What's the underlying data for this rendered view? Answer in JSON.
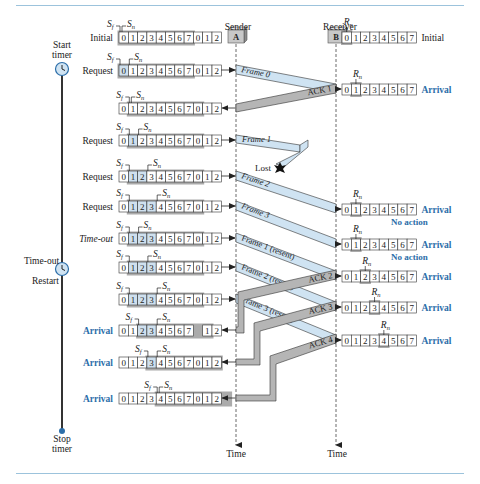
{
  "header": {
    "rule_color": "#9cc3dc"
  },
  "colors": {
    "frame_fill": "#cfe3f2",
    "ack_fill": "#b5b5b5",
    "window_shade": "#8f8f8f",
    "acked_cell": "#cfe0ee",
    "arrival_text": "#2c6ea9",
    "timer_line": "#333333",
    "stop_dot": "#2c6ea9"
  },
  "columns": {
    "sender": {
      "label": "Sender",
      "box": "A",
      "time_label": "Time"
    },
    "receiver": {
      "label": "Receiver",
      "box": "B",
      "time_label": "Time"
    }
  },
  "timer": {
    "start_label_1": "Start",
    "start_label_2": "timer",
    "timeout_label": "Time-out",
    "restart_label": "Restart",
    "stop_label_1": "Stop",
    "stop_label_2": "timer"
  },
  "sender_rows": [
    {
      "y": 37,
      "event": "Initial",
      "style": "plain",
      "cells": [
        "0",
        "1",
        "2",
        "3",
        "4",
        "5",
        "6",
        "7",
        "0",
        "1",
        "2"
      ],
      "sf": 0,
      "sn": 0,
      "acked": [],
      "shade": [
        0,
        7
      ],
      "gap": null,
      "arrow": "none"
    },
    {
      "y": 70,
      "event": "Request",
      "style": "plain",
      "cells": [
        "0",
        "1",
        "2",
        "3",
        "4",
        "5",
        "6",
        "7",
        "0",
        "1",
        "2"
      ],
      "sf": 0,
      "sn": 1,
      "acked": [
        0
      ],
      "shade": [
        0,
        7
      ],
      "gap": null,
      "arrow": "out"
    },
    {
      "y": 108,
      "event": "",
      "style": "plain",
      "cells": [
        "0",
        "1",
        "2",
        "3",
        "4",
        "5",
        "6",
        "7",
        "0",
        "1",
        "2"
      ],
      "sf": 1,
      "sn": 1,
      "acked": [],
      "shade": [
        1,
        8
      ],
      "gap": null,
      "arrow": "in"
    },
    {
      "y": 140,
      "event": "Request",
      "style": "plain",
      "cells": [
        "0",
        "1",
        "2",
        "3",
        "4",
        "5",
        "6",
        "7",
        "0",
        "1",
        "2"
      ],
      "sf": 1,
      "sn": 2,
      "acked": [
        1
      ],
      "shade": [
        1,
        8
      ],
      "gap": null,
      "arrow": "out"
    },
    {
      "y": 176,
      "event": "Request",
      "style": "plain",
      "cells": [
        "0",
        "1",
        "2",
        "3",
        "4",
        "5",
        "6",
        "7",
        "0",
        "1",
        "2"
      ],
      "sf": 1,
      "sn": 3,
      "acked": [
        1,
        2
      ],
      "shade": [
        1,
        8
      ],
      "gap": null,
      "arrow": "out"
    },
    {
      "y": 206,
      "event": "Request",
      "style": "plain",
      "cells": [
        "0",
        "1",
        "2",
        "3",
        "4",
        "5",
        "6",
        "7",
        "0",
        "1",
        "2"
      ],
      "sf": 1,
      "sn": 4,
      "acked": [
        1,
        2,
        3
      ],
      "shade": [
        1,
        8
      ],
      "gap": null,
      "arrow": "out"
    },
    {
      "y": 238,
      "event": "Time-out",
      "style": "italic",
      "cells": [
        "0",
        "1",
        "2",
        "3",
        "4",
        "5",
        "6",
        "7",
        "0",
        "1",
        "2"
      ],
      "sf": 1,
      "sn": 2,
      "acked": [
        1,
        2,
        3
      ],
      "shade": [
        1,
        8
      ],
      "gap": null,
      "arrow": "out"
    },
    {
      "y": 267,
      "event": "",
      "style": "plain",
      "cells": [
        "0",
        "1",
        "2",
        "3",
        "4",
        "5",
        "6",
        "7",
        "0",
        "1",
        "2"
      ],
      "sf": 1,
      "sn": 3,
      "acked": [
        1,
        2,
        3
      ],
      "shade": [
        1,
        8
      ],
      "gap": null,
      "arrow": "out"
    },
    {
      "y": 299,
      "event": "",
      "style": "plain",
      "cells": [
        "0",
        "1",
        "2",
        "3",
        "4",
        "5",
        "6",
        "7",
        "0",
        "1",
        "2"
      ],
      "sf": 1,
      "sn": 4,
      "acked": [
        1,
        2,
        3
      ],
      "shade": [
        1,
        8
      ],
      "gap": null,
      "arrow": "out"
    },
    {
      "y": 330,
      "event": "Arrival",
      "style": "blue",
      "cells": [
        "0",
        "1",
        "2",
        "3",
        "4",
        "5",
        "6",
        "7",
        "",
        "1",
        "2"
      ],
      "sf": 2,
      "sn": 4,
      "acked": [
        2,
        3
      ],
      "shade": [
        2,
        9
      ],
      "gap": 8,
      "arrow": "in"
    },
    {
      "y": 362,
      "event": "Arrival",
      "style": "blue",
      "cells": [
        "0",
        "1",
        "2",
        "3",
        "4",
        "5",
        "6",
        "7",
        "0",
        "1",
        "2"
      ],
      "sf": 3,
      "sn": 4,
      "acked": [
        3
      ],
      "shade": [
        3,
        10
      ],
      "gap": null,
      "arrow": "in"
    },
    {
      "y": 398,
      "event": "Arrival",
      "style": "blue",
      "cells": [
        "0",
        "1",
        "2",
        "3",
        "4",
        "5",
        "6",
        "7",
        "0",
        "1",
        "2"
      ],
      "sf": 4,
      "sn": 4,
      "acked": [],
      "shade": [
        4,
        11
      ],
      "gap": null,
      "arrow": "in"
    }
  ],
  "receiver_rows": [
    {
      "y": 37,
      "event": "Initial",
      "style": "plain",
      "note": "",
      "cells": [
        "0",
        "1",
        "2",
        "3",
        "4",
        "5",
        "6",
        "7"
      ],
      "rn": 0
    },
    {
      "y": 89,
      "event": "Arrival",
      "style": "blue",
      "note": "",
      "cells": [
        "0",
        "1",
        "2",
        "3",
        "4",
        "5",
        "6",
        "7"
      ],
      "rn": 1
    },
    {
      "y": 209,
      "event": "Arrival",
      "style": "blue",
      "note": "No action",
      "cells": [
        "0",
        "1",
        "2",
        "3",
        "4",
        "5",
        "6",
        "7"
      ],
      "rn": 1
    },
    {
      "y": 244,
      "event": "Arrival",
      "style": "blue",
      "note": "No action",
      "cells": [
        "0",
        "1",
        "2",
        "3",
        "4",
        "5",
        "6",
        "7"
      ],
      "rn": 1
    },
    {
      "y": 276,
      "event": "Arrival",
      "style": "blue",
      "note": "",
      "cells": [
        "0",
        "1",
        "2",
        "3",
        "4",
        "5",
        "6",
        "7"
      ],
      "rn": 2
    },
    {
      "y": 307,
      "event": "Arrival",
      "style": "blue",
      "note": "",
      "cells": [
        "0",
        "1",
        "2",
        "3",
        "4",
        "5",
        "6",
        "7"
      ],
      "rn": 3
    },
    {
      "y": 340,
      "event": "Arrival",
      "style": "blue",
      "note": "",
      "cells": [
        "0",
        "1",
        "2",
        "3",
        "4",
        "5",
        "6",
        "7"
      ],
      "rn": 4
    }
  ],
  "labels": {
    "sf": "S",
    "sf_sub": "f",
    "sn": "S",
    "sn_sub": "n",
    "rn": "R",
    "rn_sub": "n",
    "lost": "Lost"
  },
  "frames": [
    {
      "label": "Frame 0",
      "y_start": 70,
      "y_end": 89,
      "type": "frame"
    },
    {
      "label": "Frame 1",
      "y_start": 140,
      "y_end": 155,
      "type": "lost"
    },
    {
      "label": "Frame 2",
      "y_start": 176,
      "y_end": 209,
      "type": "frame"
    },
    {
      "label": "Frame 3",
      "y_start": 206,
      "y_end": 244,
      "type": "frame"
    },
    {
      "label": "Frame 1 (resent)",
      "y_start": 238,
      "y_end": 276,
      "type": "frame"
    },
    {
      "label": "Frame 2 (resent)",
      "y_start": 267,
      "y_end": 307,
      "type": "frame"
    },
    {
      "label": "Frame 3 (resent)",
      "y_start": 299,
      "y_end": 340,
      "type": "frame"
    }
  ],
  "acks": [
    {
      "label": "ACK 1",
      "y_start": 89,
      "y_end": 108
    },
    {
      "label": "ACK 2",
      "y_start": 276,
      "y_end": 330
    },
    {
      "label": "ACK 3",
      "y_start": 307,
      "y_end": 362
    },
    {
      "label": "ACK 4",
      "y_start": 340,
      "y_end": 398
    }
  ]
}
